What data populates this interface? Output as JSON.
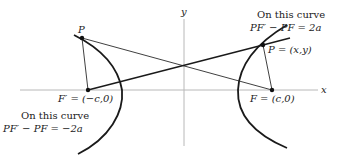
{
  "figure": {
    "type": "hyperbola-focal-definition",
    "axes": {
      "x_label": "x",
      "y_label": "y"
    },
    "foci": {
      "left": {
        "label": "F′ = (−c,0)"
      },
      "right": {
        "label": "F = (c,0)"
      }
    },
    "points": {
      "left_P": {
        "label": "P"
      },
      "right_P": {
        "label": "P = (x,y)"
      }
    },
    "annotations": {
      "right_branch": {
        "line1": "On this curve",
        "line2": "PF′ − PF = 2a"
      },
      "left_branch": {
        "line1": "On this curve",
        "line2": "PF′ − PF = −2a"
      }
    },
    "colors": {
      "curve": "#1a1a1a",
      "axis": "#b5b5b5",
      "line": "#2a2a2a"
    }
  }
}
